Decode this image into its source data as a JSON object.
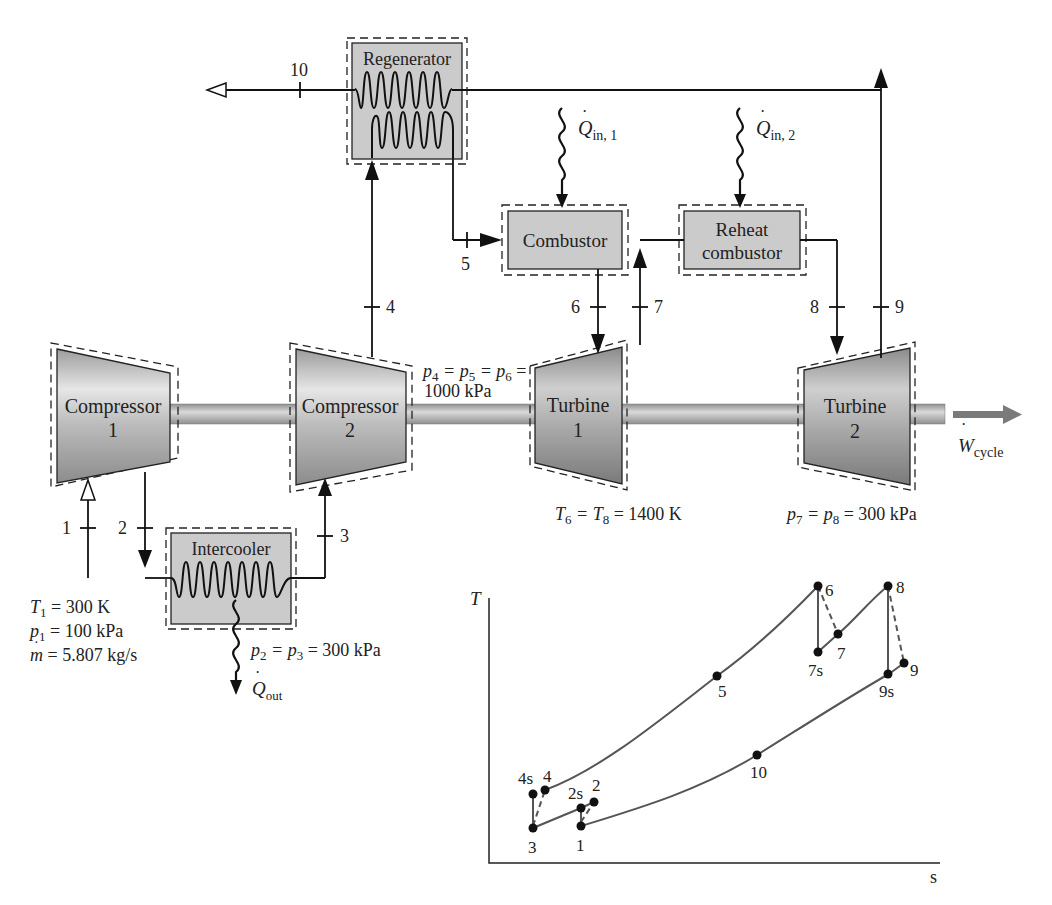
{
  "components": {
    "regenerator": "Regenerator",
    "combustor": "Combustor",
    "reheat_combustor": [
      "Reheat",
      "combustor"
    ],
    "intercooler": "Intercooler",
    "compressor1": [
      "Compressor",
      "1"
    ],
    "compressor2": [
      "Compressor",
      "2"
    ],
    "turbine1": [
      "Turbine",
      "1"
    ],
    "turbine2": [
      "Turbine",
      "2"
    ]
  },
  "state_labels": {
    "s1": "1",
    "s2": "2",
    "s3": "3",
    "s4": "4",
    "s5": "5",
    "s6": "6",
    "s7": "7",
    "s8": "8",
    "s9": "9",
    "s10": "10"
  },
  "heat_work": {
    "q_in_1": {
      "symbol": "Q",
      "sub": "in, 1"
    },
    "q_in_2": {
      "symbol": "Q",
      "sub": "in, 2"
    },
    "q_out": {
      "symbol": "Q",
      "sub": "out"
    },
    "w_cycle": {
      "symbol": "W",
      "sub": "cycle"
    }
  },
  "annotations": {
    "inlet": {
      "T1": {
        "sym": "T",
        "sub": "1",
        "rest": " = 300 K"
      },
      "p1": {
        "sym": "p",
        "sub": "1",
        "rest": " = 100 kPa"
      },
      "mdot": {
        "sym": "m",
        "rest": " = 5.807 kg/s"
      }
    },
    "p2_p3": {
      "text_a": "p",
      "sub_a": "2",
      "text_b": " = p",
      "sub_b": "3",
      "rest": " = 300 kPa"
    },
    "p4_p5_p6": {
      "line1_parts": [
        "p",
        "4",
        " = p",
        "5",
        " = p",
        "6",
        " ="
      ],
      "line2": "1000 kPa"
    },
    "T6_T8": {
      "a": "T",
      "sa": "6",
      "b": " = T",
      "sb": "8",
      "rest": " = 1400 K"
    },
    "p7_p8": {
      "a": "p",
      "sa": "7",
      "b": " = p",
      "sb": "8",
      "rest": " = 300 kPa"
    }
  },
  "ts_diagram": {
    "y_axis_label": "T",
    "x_axis_label": "s",
    "points": [
      {
        "id": "1",
        "label": "1"
      },
      {
        "id": "2s",
        "label": "2s"
      },
      {
        "id": "2",
        "label": "2"
      },
      {
        "id": "3",
        "label": "3"
      },
      {
        "id": "4s",
        "label": "4s"
      },
      {
        "id": "4",
        "label": "4"
      },
      {
        "id": "5",
        "label": "5"
      },
      {
        "id": "6",
        "label": "6"
      },
      {
        "id": "7s",
        "label": "7s"
      },
      {
        "id": "7",
        "label": "7"
      },
      {
        "id": "8",
        "label": "8"
      },
      {
        "id": "9s",
        "label": "9s"
      },
      {
        "id": "9",
        "label": "9"
      },
      {
        "id": "10",
        "label": "10"
      }
    ]
  },
  "colors": {
    "component_fill": "#c8c8c8",
    "shaft": "#b5b5b5",
    "line": "#111111",
    "curve": "#555555",
    "work_arrow": "#7a7a7a"
  }
}
